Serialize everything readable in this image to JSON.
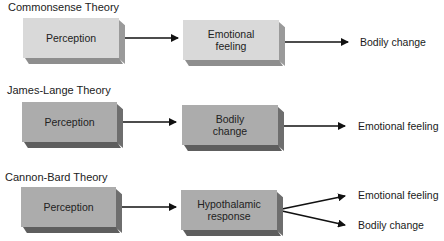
{
  "diagram": {
    "rows": [
      {
        "title": "Commonsense Theory",
        "box1": "Perception",
        "box2_line1": "Emotional",
        "box2_line2": "feeling",
        "outputs": [
          "Bodily change"
        ]
      },
      {
        "title": "James-Lange Theory",
        "box1": "Perception",
        "box2_line1": "Bodily",
        "box2_line2": "change",
        "outputs": [
          "Emotional feeling"
        ]
      },
      {
        "title": "Cannon-Bard Theory",
        "box1": "Perception",
        "box2_line1": "Hypothalamic",
        "box2_line2": "response",
        "outputs": [
          "Emotional feeling",
          "Bodily change"
        ]
      }
    ],
    "colors": {
      "row1_box_face": "#d9d9d9",
      "row2_3_box_face": "#acacac",
      "arrow": "#111111"
    }
  }
}
